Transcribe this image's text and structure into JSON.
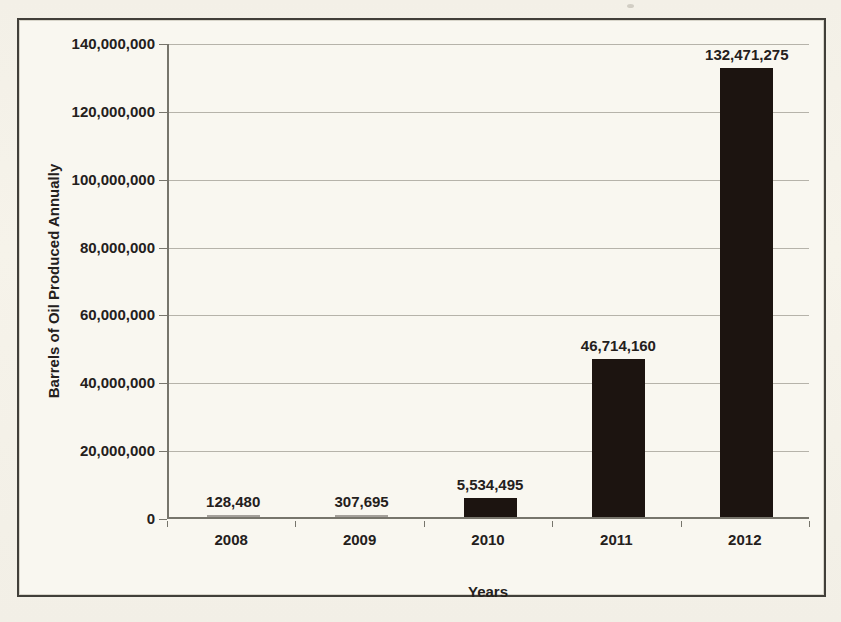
{
  "chart_data": {
    "type": "bar",
    "title": "",
    "categories": [
      "2008",
      "2009",
      "2010",
      "2011",
      "2012"
    ],
    "values": [
      128480,
      307695,
      5534495,
      46714160,
      132471275
    ],
    "data_labels": [
      "128,480",
      "307,695",
      "5,534,495",
      "46,714,160",
      "132,471,275"
    ],
    "xlabel": "Years",
    "ylabel": "Barrels of Oil Produced Annually",
    "ylim": [
      0,
      140000000
    ],
    "y_ticks": [
      0,
      20000000,
      40000000,
      60000000,
      80000000,
      100000000,
      120000000,
      140000000
    ],
    "y_tick_labels": [
      "0",
      "20,000,000",
      "40,000,000",
      "60,000,000",
      "80,000,000",
      "100,000,000",
      "120,000,000",
      "140,000,000"
    ],
    "grid": "horizontal",
    "legend": "none",
    "bar_color": "#1c1410"
  },
  "colors": {
    "page_background": "#f2efe6",
    "chart_background": "#f9f7f0",
    "frame_border": "#413f39",
    "gridline": "#b6b3aa",
    "axis_line": "#77756c",
    "text": "#24201c"
  }
}
